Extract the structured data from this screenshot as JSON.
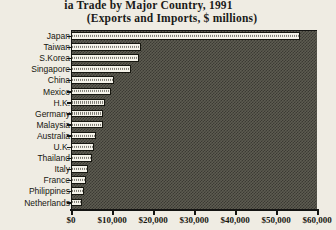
{
  "chart_data": {
    "type": "bar",
    "orientation": "horizontal",
    "title": "ia Trade by Major Country, 1991",
    "subtitle": "(Exports and Imports, $ millions)",
    "xlabel": "",
    "ylabel": "",
    "xlim": [
      0,
      60000
    ],
    "xticks": [
      0,
      10000,
      20000,
      30000,
      40000,
      50000,
      60000
    ],
    "xtick_labels": [
      "$0",
      "$10,000",
      "$20,000",
      "$30,000",
      "$40,000",
      "$50,000",
      "$60,000"
    ],
    "grid": false,
    "legend": "none",
    "categories": [
      "Japan",
      "Taiwan",
      "S.Korea",
      "Singapore",
      "China",
      "Mexico",
      "H.K.",
      "Germany",
      "Malaysia",
      "Australia",
      "U.K.",
      "Thailand",
      "Italy",
      "France",
      "Philippines",
      "Netherlands"
    ],
    "values": [
      55800,
      17100,
      16600,
      14600,
      10400,
      9700,
      8400,
      7900,
      7700,
      6000,
      5500,
      5000,
      4200,
      3700,
      3200,
      2700
    ],
    "series": [
      {
        "name": "Exports and Imports",
        "values": [
          55800,
          17100,
          16600,
          14600,
          10400,
          9700,
          8400,
          7900,
          7700,
          6000,
          5500,
          5000,
          4200,
          3700,
          3200,
          2700
        ]
      }
    ],
    "colors": {
      "bar_fill": "#f4f2e9",
      "bar_outline": "#16160f",
      "plot_background": "#5e5c52",
      "page_background": "#efece3",
      "axis": "#141412",
      "text": "#16160f"
    }
  }
}
